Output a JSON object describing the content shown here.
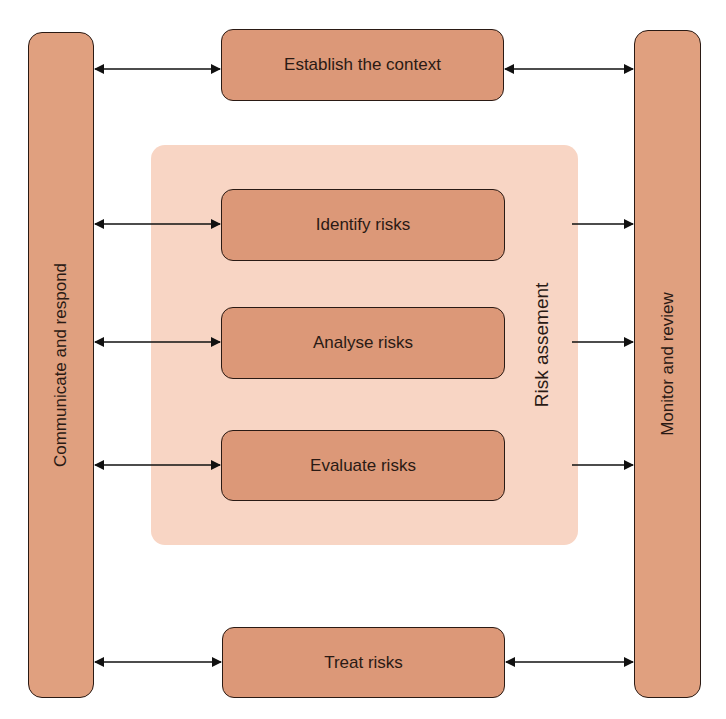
{
  "diagram": {
    "left_bar": {
      "label": "Communicate and respond"
    },
    "right_bar": {
      "label": "Monitor and review"
    },
    "region": {
      "label": "Risk assement"
    },
    "boxes": [
      {
        "id": "establish",
        "label": "Establish the context"
      },
      {
        "id": "identify",
        "label": "Identify risks"
      },
      {
        "id": "analyse",
        "label": "Analyse risks"
      },
      {
        "id": "evaluate",
        "label": "Evaluate risks"
      },
      {
        "id": "treat",
        "label": "Treat risks"
      }
    ],
    "connections": [
      {
        "from": "Communicate and respond",
        "to": "Establish the context",
        "type": "bidirectional"
      },
      {
        "from": "Establish the context",
        "to": "Monitor and review",
        "type": "bidirectional"
      },
      {
        "from": "Communicate and respond",
        "to": "Identify risks",
        "type": "bidirectional"
      },
      {
        "from": "Communicate and respond",
        "to": "Analyse risks",
        "type": "bidirectional"
      },
      {
        "from": "Communicate and respond",
        "to": "Evaluate risks",
        "type": "bidirectional"
      },
      {
        "from": "Risk assement",
        "to": "Monitor and review",
        "type": "directed",
        "count": 3
      },
      {
        "from": "Communicate and respond",
        "to": "Treat risks",
        "type": "bidirectional"
      },
      {
        "from": "Treat risks",
        "to": "Monitor and review",
        "type": "bidirectional"
      }
    ],
    "colors": {
      "box_fill": "#dc9878",
      "bar_fill": "#e0a07f",
      "region_fill": "#f8d5c4",
      "stroke": "#2a1a14"
    }
  }
}
